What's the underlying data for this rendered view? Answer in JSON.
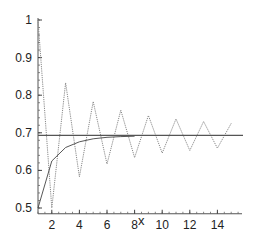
{
  "chart_data": {
    "type": "line",
    "title": "",
    "xlabel": "x",
    "ylabel": "",
    "xlim": [
      1,
      15.5
    ],
    "ylim": [
      0.49,
      1.0
    ],
    "x_ticks": [
      2,
      4,
      6,
      8,
      10,
      12,
      14
    ],
    "y_ticks": [
      0.5,
      0.6,
      0.7,
      0.8,
      0.9,
      1
    ],
    "x_tick_labels": [
      "2",
      "4",
      "6",
      "8",
      "10",
      "12",
      "14"
    ],
    "y_tick_labels": [
      "0.5",
      "0.6",
      "0.7",
      "0.8",
      "0.9",
      "1"
    ],
    "grid": false,
    "legend": null,
    "series": [
      {
        "name": "oscillating partial sums",
        "style": "dotted",
        "x": [
          1,
          2,
          3,
          4,
          5,
          6,
          7,
          8,
          9,
          10,
          11,
          12,
          13,
          14,
          15
        ],
        "values": [
          1.0,
          0.5,
          0.833,
          0.583,
          0.783,
          0.617,
          0.76,
          0.634,
          0.746,
          0.646,
          0.737,
          0.653,
          0.73,
          0.659,
          0.725
        ]
      },
      {
        "name": "monotone curve",
        "style": "solid",
        "x": [
          1,
          2,
          3,
          4,
          5,
          6,
          7,
          8
        ],
        "values": [
          0.5,
          0.625,
          0.661,
          0.676,
          0.684,
          0.688,
          0.69,
          0.691
        ]
      },
      {
        "name": "limit line",
        "style": "solid",
        "x": [
          1,
          15.5
        ],
        "values": [
          0.693,
          0.693
        ]
      }
    ]
  }
}
